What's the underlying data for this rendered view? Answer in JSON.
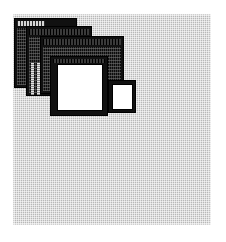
{
  "scene": {
    "name": "cascading-windows-desktop",
    "description": "Desktop showing four overlapping application windows cascaded toward the lower right",
    "desktop_color": "#b8b8b8",
    "page_background": "#ffffff",
    "window_frame_color": "#000000",
    "window_canvas_color": "#ffffff",
    "titlebar_color": "#cfcfcf"
  },
  "windows": [
    {
      "id": "window-1",
      "name": "back-window",
      "z": 1,
      "title": "",
      "state": "inactive",
      "has_titlebar": true,
      "has_canvas": false,
      "scroll_columns": 3
    },
    {
      "id": "window-2",
      "name": "second-window",
      "z": 2,
      "title": "",
      "state": "inactive",
      "has_titlebar": true,
      "has_canvas": false,
      "scroll_columns": 0
    },
    {
      "id": "window-3",
      "name": "third-window",
      "z": 3,
      "title": "",
      "state": "inactive",
      "has_titlebar": true,
      "has_canvas": false,
      "scroll_columns": 0
    },
    {
      "id": "window-4",
      "name": "front-window",
      "z": 5,
      "title": "",
      "state": "active",
      "has_titlebar": true,
      "has_canvas": true,
      "scroll_columns": 0
    },
    {
      "id": "window-5",
      "name": "small-window",
      "z": 4,
      "title": "",
      "state": "inactive",
      "has_titlebar": false,
      "has_canvas": true,
      "scroll_columns": 0
    }
  ]
}
